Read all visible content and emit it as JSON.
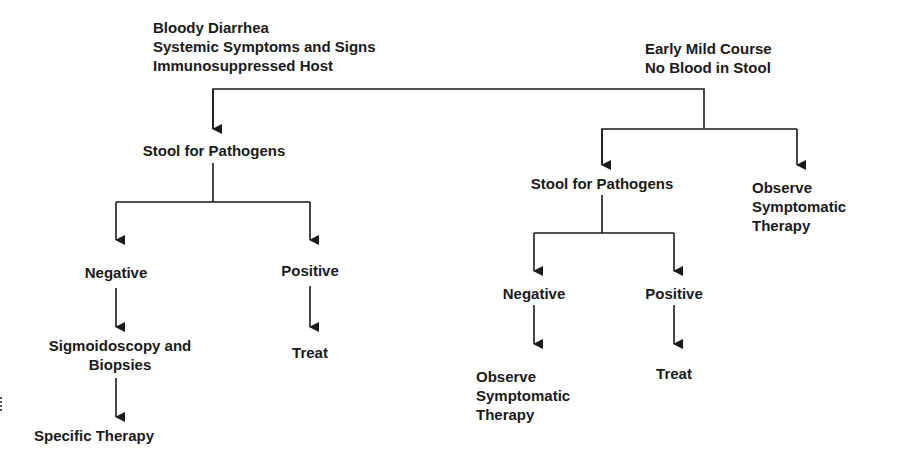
{
  "diagram": {
    "type": "flowchart",
    "left_branch": {
      "condition": [
        "Bloody Diarrhea",
        "Systemic Symptoms and Signs",
        "Immunosuppressed Host"
      ],
      "step1": "Stool for Pathogens",
      "negative": {
        "label": "Negative",
        "next": [
          "Sigmoidoscopy and",
          "Biopsies"
        ],
        "final": "Specific Therapy"
      },
      "positive": {
        "label": "Positive",
        "next": "Treat"
      }
    },
    "right_branch": {
      "condition": [
        "Early Mild Course",
        "No Blood in Stool"
      ],
      "step1": "Stool for Pathogens",
      "negative": {
        "label": "Negative",
        "next": [
          "Observe",
          "Symptomatic",
          "Therapy"
        ]
      },
      "positive": {
        "label": "Positive",
        "next": "Treat"
      },
      "alternative": [
        "Observe",
        "Symptomatic",
        "Therapy"
      ]
    }
  }
}
